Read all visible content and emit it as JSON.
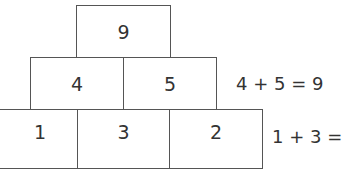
{
  "pyramid": {
    "top": [
      "9"
    ],
    "middle": [
      "4",
      "5"
    ],
    "bottom": [
      "1",
      "3",
      "2"
    ]
  },
  "equations": {
    "middle_row": "4 + 5 = 9",
    "bottom_row": "1 + 3 ="
  },
  "colors": {
    "line": "#555555",
    "text": "#333333",
    "background": "#ffffff"
  }
}
